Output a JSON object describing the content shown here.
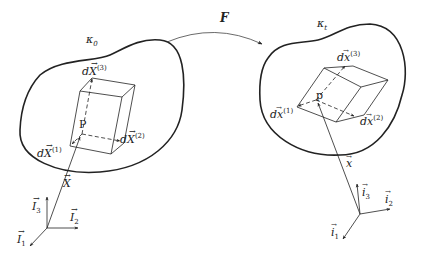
{
  "diagram": {
    "mapping": {
      "label": "F",
      "from": "reference-configuration",
      "to": "current-configuration"
    },
    "reference_configuration": {
      "name_label": "κ",
      "name_sub": "0",
      "point_label": "P",
      "position_vector": "X",
      "edge_vectors": [
        {
          "base": "dX",
          "sup": "(1)"
        },
        {
          "base": "dX",
          "sup": "(2)"
        },
        {
          "base": "dX",
          "sup": "(3)"
        }
      ],
      "basis": [
        {
          "base": "I",
          "sub": "1"
        },
        {
          "base": "I",
          "sub": "2"
        },
        {
          "base": "I",
          "sub": "3"
        }
      ]
    },
    "current_configuration": {
      "name_label": "κ",
      "name_sub": "t",
      "point_label": "p",
      "position_vector": "x",
      "edge_vectors": [
        {
          "base": "dx",
          "sup": "(1)"
        },
        {
          "base": "dx",
          "sup": "(2)"
        },
        {
          "base": "dx",
          "sup": "(3)"
        }
      ],
      "basis": [
        {
          "base": "i",
          "sub": "1"
        },
        {
          "base": "i",
          "sub": "2"
        },
        {
          "base": "i",
          "sub": "3"
        }
      ]
    },
    "colors": {
      "stroke": "#222222",
      "background": "#ffffff"
    }
  }
}
